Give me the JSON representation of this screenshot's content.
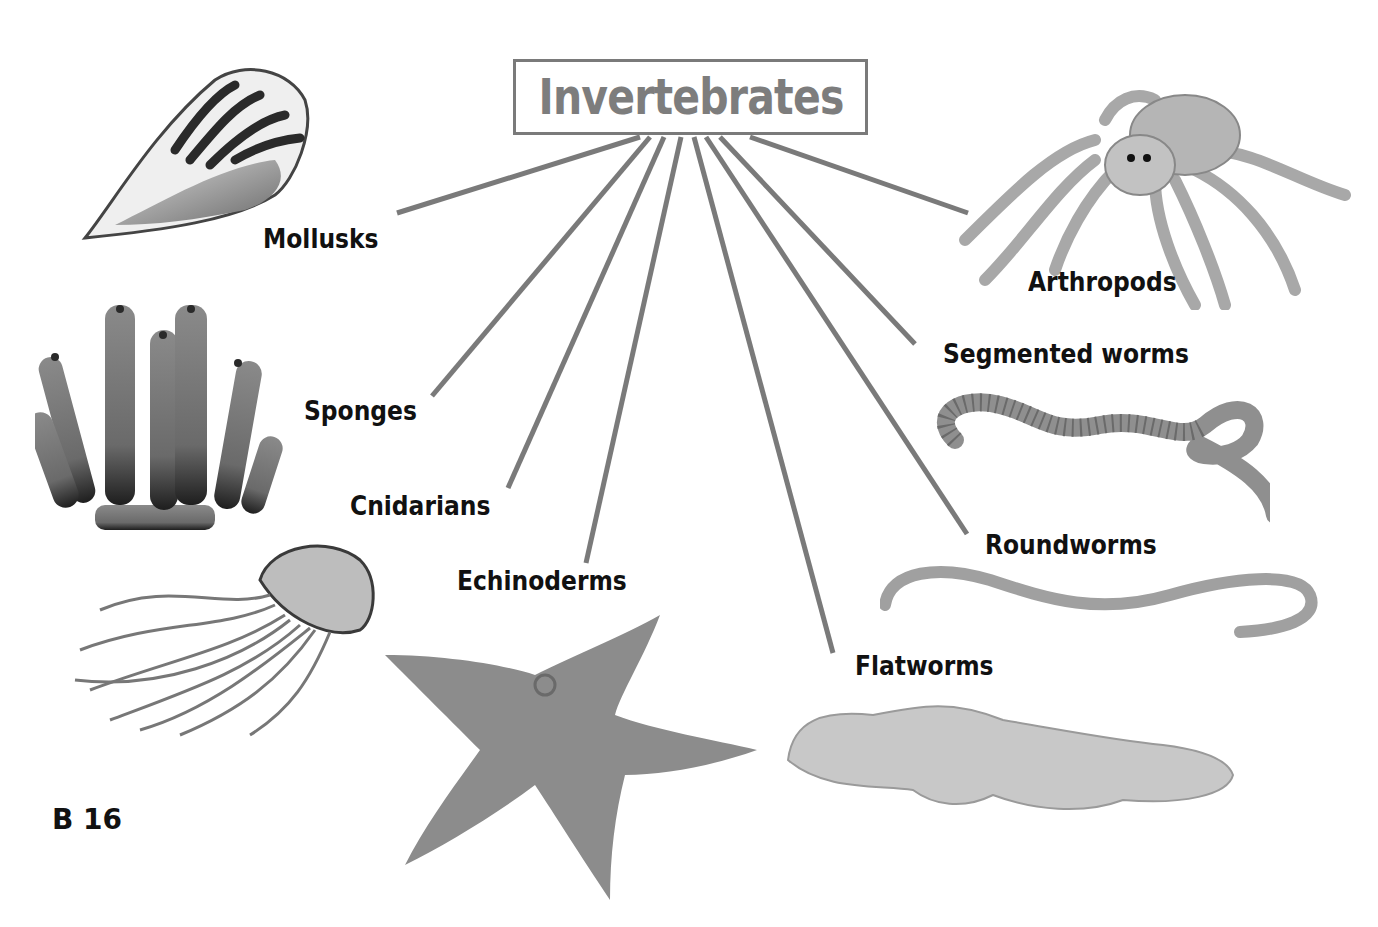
{
  "diagram": {
    "title": "Invertebrates",
    "page_number": "B 16",
    "line_color": "#7a7a7a",
    "categories": [
      {
        "id": "mollusks",
        "label": "Mollusks",
        "illustration": "conch-shell"
      },
      {
        "id": "sponges",
        "label": "Sponges",
        "illustration": "tube-sponge"
      },
      {
        "id": "cnidarians",
        "label": "Cnidarians",
        "illustration": "jellyfish"
      },
      {
        "id": "echinoderms",
        "label": "Echinoderms",
        "illustration": "sea-star"
      },
      {
        "id": "flatworms",
        "label": "Flatworms",
        "illustration": "flatworm"
      },
      {
        "id": "roundworms",
        "label": "Roundworms",
        "illustration": "roundworm"
      },
      {
        "id": "segmented-worms",
        "label": "Segmented worms",
        "illustration": "earthworm"
      },
      {
        "id": "arthropods",
        "label": "Arthropods",
        "illustration": "spider"
      }
    ]
  }
}
